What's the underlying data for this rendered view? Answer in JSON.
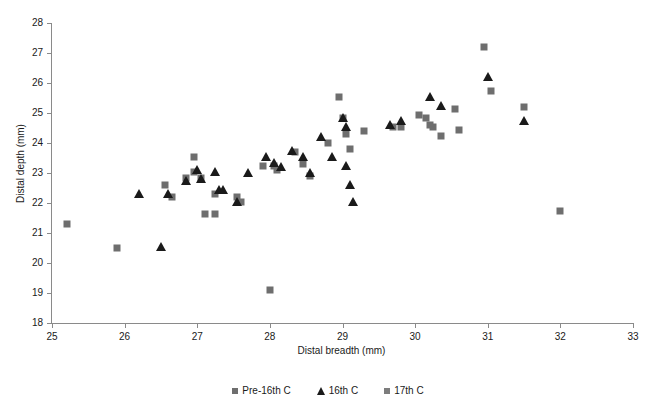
{
  "chart_data": {
    "type": "scatter",
    "title": "",
    "xlabel": "Distal breadth (mm)",
    "ylabel": "Distal depth (mm)",
    "xlim": [
      25,
      33
    ],
    "ylim": [
      18,
      28
    ],
    "xticks": [
      25,
      26,
      27,
      28,
      29,
      30,
      31,
      32,
      33
    ],
    "yticks": [
      18,
      19,
      20,
      21,
      22,
      23,
      24,
      25,
      26,
      27,
      28
    ],
    "grid": false,
    "legend_position": "bottom",
    "series": [
      {
        "name": "Pre-16th C",
        "marker": "square",
        "color": "#6e6e6e",
        "points": [
          [
            25.2,
            21.3
          ],
          [
            25.9,
            20.5
          ],
          [
            26.55,
            22.6
          ],
          [
            26.65,
            22.2
          ],
          [
            26.85,
            22.85
          ],
          [
            26.95,
            23.05
          ],
          [
            26.95,
            23.55
          ],
          [
            27.05,
            22.85
          ],
          [
            27.1,
            21.65
          ],
          [
            27.25,
            22.3
          ],
          [
            27.25,
            21.65
          ],
          [
            27.55,
            22.2
          ],
          [
            27.6,
            22.05
          ],
          [
            27.9,
            23.25
          ],
          [
            28.0,
            19.1
          ],
          [
            28.05,
            23.25
          ],
          [
            28.1,
            23.1
          ],
          [
            28.35,
            23.7
          ],
          [
            28.45,
            23.3
          ],
          [
            28.55,
            22.9
          ],
          [
            28.8,
            24.0
          ],
          [
            28.95,
            25.55
          ],
          [
            29.0,
            24.85
          ],
          [
            29.05,
            24.3
          ],
          [
            29.1,
            23.8
          ],
          [
            29.3,
            24.4
          ],
          [
            29.7,
            24.55
          ],
          [
            29.8,
            24.55
          ],
          [
            30.05,
            24.95
          ],
          [
            30.15,
            24.85
          ],
          [
            30.2,
            24.6
          ],
          [
            30.25,
            24.55
          ],
          [
            30.35,
            24.25
          ],
          [
            30.55,
            25.15
          ],
          [
            30.6,
            24.45
          ],
          [
            30.95,
            27.2
          ],
          [
            31.05,
            25.75
          ],
          [
            31.5,
            25.2
          ],
          [
            32.0,
            21.75
          ]
        ]
      },
      {
        "name": "16th C",
        "marker": "triangle",
        "color": "#1a1a1a",
        "points": [
          [
            26.2,
            22.3
          ],
          [
            26.5,
            20.55
          ],
          [
            26.6,
            22.3
          ],
          [
            26.85,
            22.75
          ],
          [
            27.0,
            23.1
          ],
          [
            27.05,
            22.8
          ],
          [
            27.25,
            23.05
          ],
          [
            27.3,
            22.45
          ],
          [
            27.35,
            22.45
          ],
          [
            27.55,
            22.05
          ],
          [
            27.7,
            23.0
          ],
          [
            27.95,
            23.55
          ],
          [
            28.05,
            23.35
          ],
          [
            28.15,
            23.2
          ],
          [
            28.3,
            23.75
          ],
          [
            28.45,
            23.55
          ],
          [
            28.55,
            23.0
          ],
          [
            28.7,
            24.2
          ],
          [
            28.85,
            23.55
          ],
          [
            29.0,
            24.85
          ],
          [
            29.05,
            24.55
          ],
          [
            29.05,
            23.25
          ],
          [
            29.1,
            22.6
          ],
          [
            29.15,
            22.05
          ],
          [
            29.65,
            24.6
          ],
          [
            29.8,
            24.75
          ],
          [
            30.2,
            25.55
          ],
          [
            30.35,
            25.25
          ],
          [
            31.0,
            26.2
          ],
          [
            31.5,
            24.75
          ]
        ]
      },
      {
        "name": "17th C",
        "marker": "square",
        "color": "#7d7d7d",
        "points": []
      }
    ]
  },
  "legend": {
    "items": [
      {
        "label": "Pre-16th C",
        "marker": "square",
        "color": "#6e6e6e"
      },
      {
        "label": "16th C",
        "marker": "triangle",
        "color": "#1a1a1a"
      },
      {
        "label": "17th C",
        "marker": "square",
        "color": "#7d7d7d"
      }
    ]
  }
}
